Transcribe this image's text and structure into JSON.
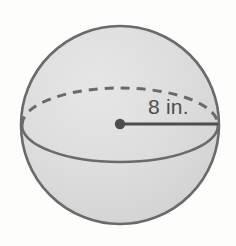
{
  "figure": {
    "name": "sphere-with-radius",
    "shape": "sphere",
    "background_color": "#fdfdfc",
    "sphere": {
      "fill_color": "#dcdcdc",
      "outline_color": "#6a6a6a",
      "center_x": 120,
      "center_y": 125,
      "radius_px": 99
    },
    "equator": {
      "rx": 98,
      "ry": 37,
      "back_half_style": "dashed",
      "front_half_style": "solid",
      "dash_pattern": "8 7",
      "stroke_color": "#6a6a6a"
    },
    "radius_segment": {
      "from_x": 120,
      "from_y": 124,
      "to_x": 218,
      "to_y": 124,
      "stroke_color": "#4d4d4d",
      "endpoint_dot_radius": 5
    },
    "labels": {
      "radius_label": "8 in.",
      "radius_label_x": 148,
      "radius_label_y": 114,
      "radius_label_color": "#4d4d4d"
    }
  }
}
